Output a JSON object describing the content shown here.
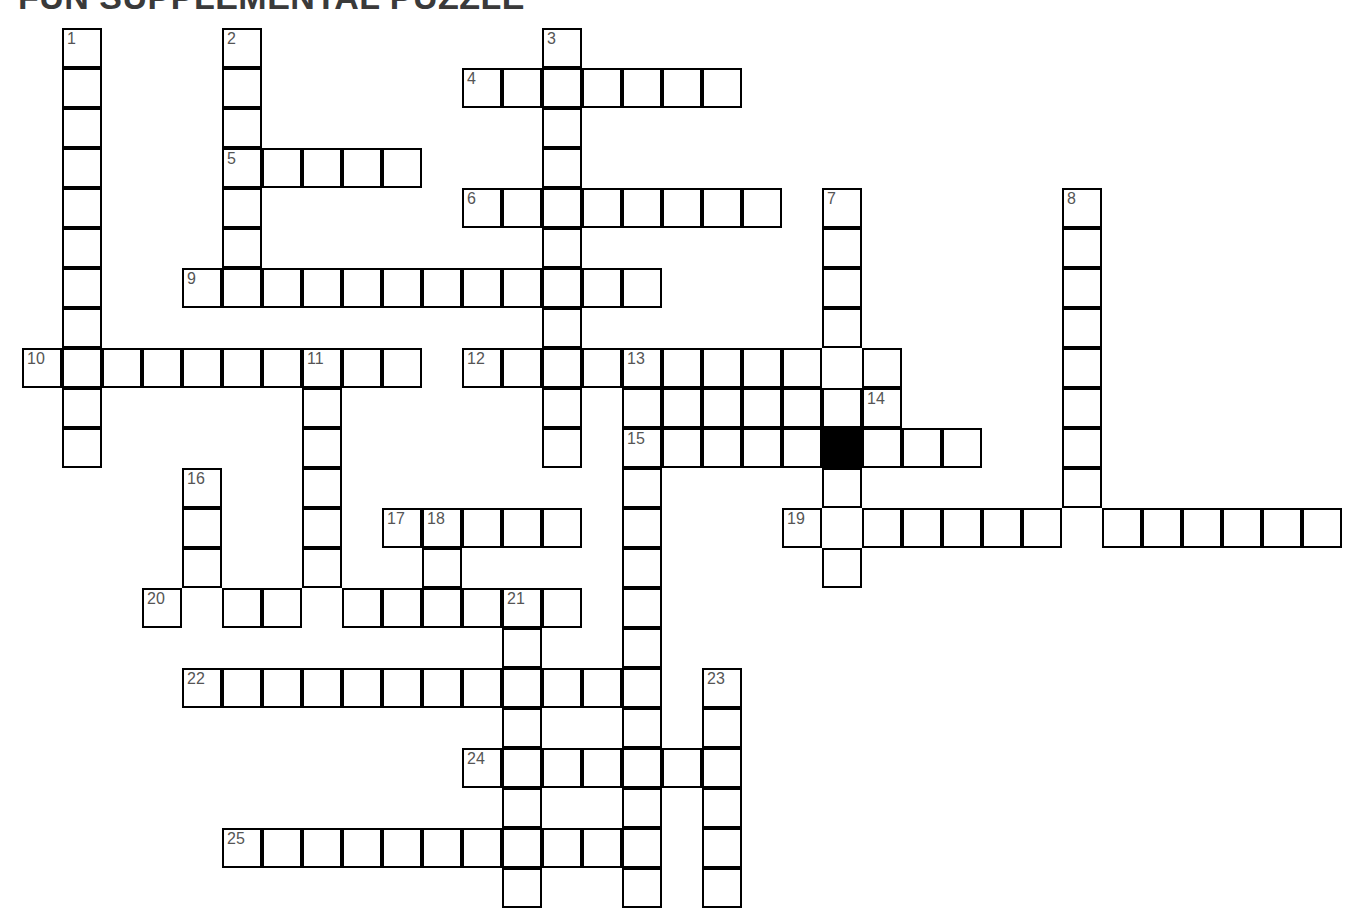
{
  "title": "FUN SUPPLEMENTAL PUZZLE",
  "puzzle": {
    "type": "crossword-grid",
    "cell_size": 40,
    "origin_x": 22,
    "origin_y": 28,
    "colors": {
      "cell_fill": "#ffffff",
      "cell_border": "#000000",
      "blocked_fill": "#000000",
      "number_text": "#555555",
      "title_text": "#3a3a3a",
      "page_background": "#ffffff"
    },
    "clue_count": 25,
    "numbers_visible": [
      1,
      2,
      3,
      4,
      5,
      6,
      7,
      8,
      9,
      10,
      11,
      12,
      13,
      14,
      15,
      16,
      17,
      18,
      19,
      20,
      21,
      22,
      23,
      24,
      25
    ],
    "blocked_cells": [
      [
        20,
        10
      ]
    ],
    "entries": [
      {
        "number": 1,
        "direction": "down",
        "col": 1,
        "row": 0,
        "length": 11
      },
      {
        "number": 2,
        "direction": "down",
        "col": 5,
        "row": 0,
        "length": 7
      },
      {
        "number": 3,
        "direction": "down",
        "col": 13,
        "row": 0,
        "length": 11
      },
      {
        "number": 4,
        "direction": "across",
        "col": 11,
        "row": 1,
        "length": 7
      },
      {
        "number": 5,
        "direction": "across",
        "col": 5,
        "row": 3,
        "length": 5
      },
      {
        "number": 6,
        "direction": "across",
        "col": 11,
        "row": 4,
        "length": 8
      },
      {
        "number": 7,
        "direction": "down",
        "col": 20,
        "row": 4,
        "length": 10
      },
      {
        "number": 8,
        "direction": "down",
        "col": 26,
        "row": 4,
        "length": 9
      },
      {
        "number": 9,
        "direction": "across",
        "col": 4,
        "row": 6,
        "length": 12
      },
      {
        "number": 10,
        "direction": "across",
        "col": 0,
        "row": 8,
        "length": 10
      },
      {
        "number": 11,
        "direction": "down",
        "col": 7,
        "row": 8,
        "length": 7
      },
      {
        "number": 12,
        "direction": "across",
        "col": 11,
        "row": 8,
        "length": 11
      },
      {
        "number": 13,
        "direction": "down",
        "col": 15,
        "row": 8,
        "length": 14
      },
      {
        "number": 14,
        "direction": "across",
        "col": 21,
        "row": 9,
        "length": 1
      },
      {
        "number": 15,
        "direction": "across",
        "col": 15,
        "row": 10,
        "length": 9
      },
      {
        "number": 16,
        "direction": "down",
        "col": 4,
        "row": 11,
        "length": 4
      },
      {
        "number": 17,
        "direction": "across",
        "col": 9,
        "row": 12,
        "length": 5
      },
      {
        "number": 18,
        "direction": "down",
        "col": 10,
        "row": 12,
        "length": 4
      },
      {
        "number": 19,
        "direction": "across",
        "col": 19,
        "row": 12,
        "length": 14
      },
      {
        "number": 20,
        "direction": "across",
        "col": 3,
        "row": 14,
        "length": 11
      },
      {
        "number": 21,
        "direction": "down",
        "col": 12,
        "row": 14,
        "length": 8
      },
      {
        "number": 22,
        "direction": "across",
        "col": 4,
        "row": 16,
        "length": 9
      },
      {
        "number": 23,
        "direction": "down",
        "col": 17,
        "row": 16,
        "length": 6
      },
      {
        "number": 24,
        "direction": "across",
        "col": 11,
        "row": 18,
        "length": 7
      },
      {
        "number": 25,
        "direction": "across",
        "col": 5,
        "row": 20,
        "length": 9
      }
    ],
    "cells": [
      {
        "c": 1,
        "r": 0,
        "n": "1"
      },
      {
        "c": 1,
        "r": 1
      },
      {
        "c": 1,
        "r": 2
      },
      {
        "c": 1,
        "r": 3
      },
      {
        "c": 1,
        "r": 4
      },
      {
        "c": 1,
        "r": 5
      },
      {
        "c": 1,
        "r": 6
      },
      {
        "c": 1,
        "r": 7
      },
      {
        "c": 1,
        "r": 8
      },
      {
        "c": 1,
        "r": 9
      },
      {
        "c": 1,
        "r": 10
      },
      {
        "c": 5,
        "r": 0,
        "n": "2"
      },
      {
        "c": 5,
        "r": 1
      },
      {
        "c": 5,
        "r": 2
      },
      {
        "c": 5,
        "r": 3,
        "n": "5"
      },
      {
        "c": 5,
        "r": 4
      },
      {
        "c": 5,
        "r": 5
      },
      {
        "c": 5,
        "r": 6
      },
      {
        "c": 13,
        "r": 0,
        "n": "3"
      },
      {
        "c": 13,
        "r": 1
      },
      {
        "c": 13,
        "r": 2
      },
      {
        "c": 13,
        "r": 3
      },
      {
        "c": 13,
        "r": 4
      },
      {
        "c": 13,
        "r": 5
      },
      {
        "c": 13,
        "r": 6
      },
      {
        "c": 13,
        "r": 7
      },
      {
        "c": 13,
        "r": 8
      },
      {
        "c": 13,
        "r": 9
      },
      {
        "c": 13,
        "r": 10
      },
      {
        "c": 11,
        "r": 1,
        "n": "4"
      },
      {
        "c": 12,
        "r": 1
      },
      {
        "c": 14,
        "r": 1
      },
      {
        "c": 15,
        "r": 1
      },
      {
        "c": 16,
        "r": 1
      },
      {
        "c": 17,
        "r": 1
      },
      {
        "c": 6,
        "r": 3
      },
      {
        "c": 7,
        "r": 3
      },
      {
        "c": 8,
        "r": 3
      },
      {
        "c": 9,
        "r": 3
      },
      {
        "c": 11,
        "r": 4,
        "n": "6"
      },
      {
        "c": 12,
        "r": 4
      },
      {
        "c": 14,
        "r": 4
      },
      {
        "c": 15,
        "r": 4
      },
      {
        "c": 16,
        "r": 4
      },
      {
        "c": 17,
        "r": 4
      },
      {
        "c": 18,
        "r": 4
      },
      {
        "c": 20,
        "r": 4,
        "n": "7"
      },
      {
        "c": 20,
        "r": 5
      },
      {
        "c": 20,
        "r": 6
      },
      {
        "c": 20,
        "r": 7
      },
      {
        "c": 20,
        "r": 9
      },
      {
        "c": 20,
        "r": 10
      },
      {
        "c": 20,
        "r": 11
      },
      {
        "c": 20,
        "r": 13
      },
      {
        "c": 26,
        "r": 4,
        "n": "8"
      },
      {
        "c": 26,
        "r": 5
      },
      {
        "c": 26,
        "r": 6
      },
      {
        "c": 26,
        "r": 7
      },
      {
        "c": 26,
        "r": 8
      },
      {
        "c": 26,
        "r": 9
      },
      {
        "c": 26,
        "r": 10
      },
      {
        "c": 26,
        "r": 11
      },
      {
        "c": 4,
        "r": 6,
        "n": "9"
      },
      {
        "c": 6,
        "r": 6
      },
      {
        "c": 7,
        "r": 6
      },
      {
        "c": 8,
        "r": 6
      },
      {
        "c": 9,
        "r": 6
      },
      {
        "c": 10,
        "r": 6
      },
      {
        "c": 11,
        "r": 6
      },
      {
        "c": 12,
        "r": 6
      },
      {
        "c": 14,
        "r": 6
      },
      {
        "c": 15,
        "r": 6
      },
      {
        "c": 0,
        "r": 8,
        "n": "10"
      },
      {
        "c": 2,
        "r": 8
      },
      {
        "c": 3,
        "r": 8
      },
      {
        "c": 4,
        "r": 8
      },
      {
        "c": 5,
        "r": 8
      },
      {
        "c": 6,
        "r": 8
      },
      {
        "c": 7,
        "r": 8,
        "n": "11"
      },
      {
        "c": 8,
        "r": 8
      },
      {
        "c": 9,
        "r": 8
      },
      {
        "c": 7,
        "r": 9
      },
      {
        "c": 7,
        "r": 10
      },
      {
        "c": 7,
        "r": 11
      },
      {
        "c": 7,
        "r": 12
      },
      {
        "c": 7,
        "r": 13
      },
      {
        "c": 11,
        "r": 8,
        "n": "12"
      },
      {
        "c": 12,
        "r": 8
      },
      {
        "c": 14,
        "r": 8
      },
      {
        "c": 15,
        "r": 8,
        "n": "13"
      },
      {
        "c": 16,
        "r": 8
      },
      {
        "c": 17,
        "r": 8
      },
      {
        "c": 18,
        "r": 8
      },
      {
        "c": 19,
        "r": 8
      },
      {
        "c": 21,
        "r": 8
      },
      {
        "c": 15,
        "r": 9
      },
      {
        "c": 16,
        "r": 9
      },
      {
        "c": 17,
        "r": 9
      },
      {
        "c": 18,
        "r": 9
      },
      {
        "c": 19,
        "r": 9
      },
      {
        "c": 21,
        "r": 9,
        "n": "14"
      },
      {
        "c": 15,
        "r": 10,
        "n": "15"
      },
      {
        "c": 16,
        "r": 10
      },
      {
        "c": 17,
        "r": 10
      },
      {
        "c": 18,
        "r": 10
      },
      {
        "c": 19,
        "r": 10
      },
      {
        "c": 21,
        "r": 10
      },
      {
        "c": 22,
        "r": 10
      },
      {
        "c": 23,
        "r": 10
      },
      {
        "c": 15,
        "r": 11
      },
      {
        "c": 15,
        "r": 12
      },
      {
        "c": 15,
        "r": 13
      },
      {
        "c": 15,
        "r": 14
      },
      {
        "c": 15,
        "r": 15
      },
      {
        "c": 15,
        "r": 16
      },
      {
        "c": 15,
        "r": 17
      },
      {
        "c": 15,
        "r": 18
      },
      {
        "c": 15,
        "r": 19
      },
      {
        "c": 15,
        "r": 20
      },
      {
        "c": 15,
        "r": 21
      },
      {
        "c": 4,
        "r": 11,
        "n": "16"
      },
      {
        "c": 4,
        "r": 12
      },
      {
        "c": 4,
        "r": 13
      },
      {
        "c": 9,
        "r": 12,
        "n": "17"
      },
      {
        "c": 10,
        "r": 12,
        "n": "18"
      },
      {
        "c": 11,
        "r": 12
      },
      {
        "c": 12,
        "r": 12
      },
      {
        "c": 13,
        "r": 12
      },
      {
        "c": 10,
        "r": 13
      },
      {
        "c": 10,
        "r": 14
      },
      {
        "c": 19,
        "r": 12,
        "n": "19"
      },
      {
        "c": 21,
        "r": 12
      },
      {
        "c": 22,
        "r": 12
      },
      {
        "c": 23,
        "r": 12
      },
      {
        "c": 24,
        "r": 12
      },
      {
        "c": 25,
        "r": 12
      },
      {
        "c": 27,
        "r": 12
      },
      {
        "c": 28,
        "r": 12
      },
      {
        "c": 29,
        "r": 12
      },
      {
        "c": 30,
        "r": 12
      },
      {
        "c": 31,
        "r": 12
      },
      {
        "c": 32,
        "r": 12
      },
      {
        "c": 3,
        "r": 14,
        "n": "20"
      },
      {
        "c": 5,
        "r": 14
      },
      {
        "c": 6,
        "r": 14
      },
      {
        "c": 8,
        "r": 14
      },
      {
        "c": 9,
        "r": 14
      },
      {
        "c": 11,
        "r": 14
      },
      {
        "c": 12,
        "r": 14,
        "n": "21"
      },
      {
        "c": 13,
        "r": 14
      },
      {
        "c": 12,
        "r": 15
      },
      {
        "c": 12,
        "r": 16
      },
      {
        "c": 12,
        "r": 17
      },
      {
        "c": 12,
        "r": 18
      },
      {
        "c": 12,
        "r": 19
      },
      {
        "c": 12,
        "r": 20
      },
      {
        "c": 12,
        "r": 21
      },
      {
        "c": 4,
        "r": 16,
        "n": "22"
      },
      {
        "c": 5,
        "r": 16
      },
      {
        "c": 6,
        "r": 16
      },
      {
        "c": 7,
        "r": 16
      },
      {
        "c": 8,
        "r": 16
      },
      {
        "c": 9,
        "r": 16
      },
      {
        "c": 10,
        "r": 16
      },
      {
        "c": 11,
        "r": 16
      },
      {
        "c": 13,
        "r": 16
      },
      {
        "c": 14,
        "r": 16
      },
      {
        "c": 17,
        "r": 16,
        "n": "23"
      },
      {
        "c": 17,
        "r": 17
      },
      {
        "c": 17,
        "r": 18
      },
      {
        "c": 17,
        "r": 19
      },
      {
        "c": 17,
        "r": 20
      },
      {
        "c": 17,
        "r": 21
      },
      {
        "c": 11,
        "r": 18,
        "n": "24"
      },
      {
        "c": 13,
        "r": 18
      },
      {
        "c": 14,
        "r": 18
      },
      {
        "c": 16,
        "r": 18
      },
      {
        "c": 5,
        "r": 20,
        "n": "25"
      },
      {
        "c": 6,
        "r": 20
      },
      {
        "c": 7,
        "r": 20
      },
      {
        "c": 8,
        "r": 20
      },
      {
        "c": 9,
        "r": 20
      },
      {
        "c": 10,
        "r": 20
      },
      {
        "c": 11,
        "r": 20
      },
      {
        "c": 13,
        "r": 20
      },
      {
        "c": 14,
        "r": 20
      }
    ]
  }
}
